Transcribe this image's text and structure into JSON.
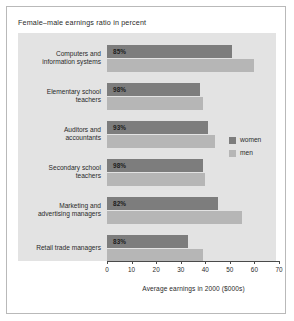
{
  "chart_data": {
    "type": "bar",
    "orientation": "horizontal",
    "title": "Female–male earnings ratio in percent",
    "xlabel": "Average earnings in 2000 ($000s)",
    "ylabel": "",
    "xlim": [
      0,
      70
    ],
    "xticks": [
      0,
      10,
      20,
      30,
      40,
      50,
      60,
      70
    ],
    "xtick_labels": [
      "0",
      "10",
      "20",
      "30",
      "40",
      "50",
      "60",
      "70"
    ],
    "grid": false,
    "legend_position": "right-center",
    "categories": [
      "Computers and information systems",
      "Elementary school teachers",
      "Auditors and accountants",
      "Secondary school teachers",
      "Marketing and advertising managers",
      "Retail trade managers"
    ],
    "category_lines": [
      [
        "Computers and",
        "information systems"
      ],
      [
        "Elementary school",
        "teachers"
      ],
      [
        "Auditors and",
        "accountants"
      ],
      [
        "Secondary school",
        "teachers"
      ],
      [
        "Marketing and",
        "advertising managers"
      ],
      [
        "Retail trade managers"
      ]
    ],
    "annotations": [
      "85%",
      "98%",
      "93%",
      "98%",
      "82%",
      "83%"
    ],
    "series": [
      {
        "name": "women",
        "color": "#7d7d7d",
        "values": [
          51,
          38,
          41,
          39,
          45,
          33
        ]
      },
      {
        "name": "men",
        "color": "#b6b6b6",
        "values": [
          60,
          39,
          44,
          40,
          55,
          39
        ]
      }
    ]
  },
  "legend": {
    "items": [
      {
        "label": "women"
      },
      {
        "label": "men"
      }
    ]
  },
  "colors": {
    "women_bar": "#7d7d7d",
    "men_bar": "#b6b6b6",
    "plot_background": "#e3e3e3",
    "figure_border": "#b9b9b9",
    "axis": "#4a4a4a"
  }
}
